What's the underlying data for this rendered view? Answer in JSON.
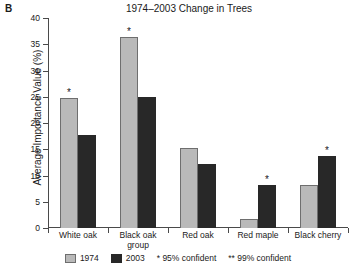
{
  "panel": {
    "letter": "B"
  },
  "chart_data": {
    "type": "bar",
    "title": "1974–2003 Change in Trees",
    "xlabel": "",
    "ylabel": "Average Importance Value (%)",
    "ylim": [
      0,
      40
    ],
    "yticks": [
      0,
      5,
      10,
      15,
      20,
      25,
      30,
      35,
      40
    ],
    "ytick_labels": [
      "0",
      "5",
      "10",
      "15",
      "20",
      "25",
      "30",
      "35",
      "40"
    ],
    "grid": false,
    "legend_position": "bottom",
    "categories": [
      "White oak",
      "Black oak group",
      "Red oak",
      "Red maple",
      "Black cherry"
    ],
    "category_lines": [
      [
        "White oak",
        ""
      ],
      [
        "Black oak",
        "group"
      ],
      [
        "Red oak",
        ""
      ],
      [
        "Red maple",
        ""
      ],
      [
        "Black cherry",
        ""
      ]
    ],
    "series": [
      {
        "name": "1974",
        "color": "#b9b9b9",
        "values": [
          24.7,
          36.4,
          15.2,
          1.8,
          8.2
        ],
        "annotations": [
          "*",
          "*",
          "",
          "",
          ""
        ]
      },
      {
        "name": "2003",
        "color": "#282828",
        "values": [
          17.8,
          25.0,
          12.2,
          8.2,
          13.8
        ],
        "annotations": [
          "",
          "",
          "",
          "*",
          "*"
        ]
      }
    ],
    "legend_entries": [
      "1974",
      "2003"
    ],
    "legend_notes": [
      "* 95% confident",
      "** 99% confident"
    ]
  }
}
